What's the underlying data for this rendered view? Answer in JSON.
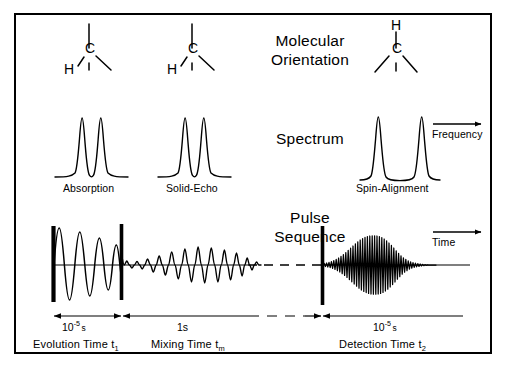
{
  "figure": {
    "background": "#ffffff",
    "ink": "#000000"
  },
  "rows": {
    "molecular_orientation": {
      "title_line1": "Molecular",
      "title_line2": "Orientation",
      "molecules": [
        {
          "id": "mol-evolution",
          "carbon_label": "C",
          "hydrogen_label": "H",
          "hydrogen_position": "lower-left"
        },
        {
          "id": "mol-mixing",
          "carbon_label": "C",
          "hydrogen_label": "H",
          "hydrogen_position": "lower-left"
        },
        {
          "id": "mol-detection",
          "carbon_label": "C",
          "hydrogen_label": "H",
          "hydrogen_position": "top"
        }
      ]
    },
    "spectrum": {
      "title": "Spectrum",
      "axis_label": "Frequency",
      "traces": [
        {
          "id": "spec-absorption",
          "caption": "Absorption",
          "splitting": "narrow",
          "peaks": 2
        },
        {
          "id": "spec-solid-echo",
          "caption": "Solid-Echo",
          "splitting": "narrow",
          "peaks": 2
        },
        {
          "id": "spec-spin-alignment",
          "caption": "Spin-Alignment",
          "splitting": "wide",
          "peaks": 2
        }
      ]
    },
    "pulse_sequence": {
      "title_line1": "Pulse",
      "title_line2": "Sequence",
      "axis_label": "Time",
      "pulses": [
        {
          "id": "pulse-1",
          "period": "evolution-start"
        },
        {
          "id": "pulse-2",
          "period": "evolution-end"
        },
        {
          "id": "pulse-3",
          "period": "detection-start"
        }
      ],
      "periods": [
        {
          "id": "period-evolution",
          "duration_mantissa": "10",
          "duration_exponent": "-5",
          "duration_unit": "s",
          "name": "Evolution Time",
          "symbol": "t",
          "symbol_sub": "1"
        },
        {
          "id": "period-mixing",
          "duration_mantissa": "1",
          "duration_exponent": "",
          "duration_unit": "s",
          "name": "Mixing  Time",
          "symbol": "t",
          "symbol_sub": "m"
        },
        {
          "id": "period-detection",
          "duration_mantissa": "10",
          "duration_exponent": "-5",
          "duration_unit": "s",
          "name": "Detection Time",
          "symbol": "t",
          "symbol_sub": "2"
        }
      ],
      "signals": [
        {
          "id": "fid-evolution",
          "kind": "damped-oscillation",
          "note": "free induction decay during t1"
        },
        {
          "id": "fid-mixing",
          "kind": "modulated-decay",
          "note": "signal during mixing time tm"
        },
        {
          "id": "fid-detection",
          "kind": "echo",
          "note": "spin-alignment echo during t2"
        }
      ]
    }
  }
}
